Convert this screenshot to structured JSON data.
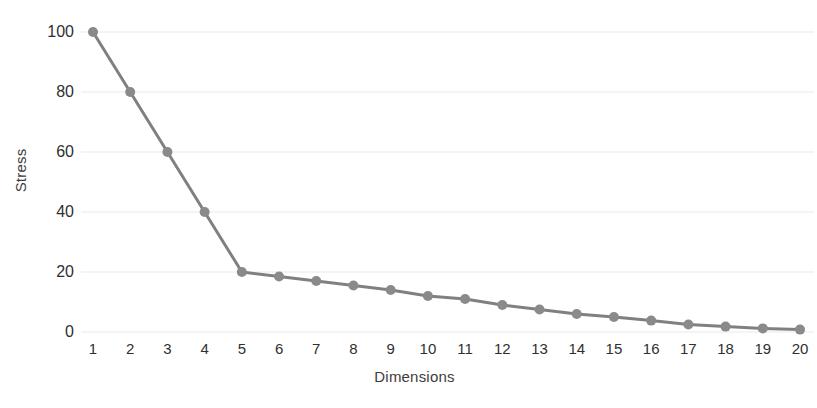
{
  "chart_data": {
    "type": "line",
    "title": "",
    "subtitle": "",
    "xlabel": "Dimensions",
    "ylabel": "Stress",
    "categories": [
      1,
      2,
      3,
      4,
      5,
      6,
      7,
      8,
      9,
      10,
      11,
      12,
      13,
      14,
      15,
      16,
      17,
      18,
      19,
      20
    ],
    "x_tick_labels": [
      "1",
      "2",
      "3",
      "4",
      "5",
      "6",
      "7",
      "8",
      "9",
      "10",
      "11",
      "12",
      "13",
      "14",
      "15",
      "16",
      "17",
      "18",
      "19",
      "20"
    ],
    "y_tick_labels": [
      "0",
      "20",
      "40",
      "60",
      "80",
      "100"
    ],
    "y_ticks": [
      0,
      20,
      40,
      60,
      80,
      100
    ],
    "values": [
      100,
      80,
      60,
      40,
      20,
      18.5,
      17,
      15.5,
      14,
      12,
      11,
      9,
      7.5,
      6,
      5,
      3.8,
      2.5,
      1.8,
      1.2,
      0.8
    ],
    "series": [
      {
        "name": "Stress",
        "values": [
          100,
          80,
          60,
          40,
          20,
          18.5,
          17,
          15.5,
          14,
          12,
          11,
          9,
          7.5,
          6,
          5,
          3.8,
          2.5,
          1.8,
          1.2,
          0.8
        ]
      }
    ],
    "xlim": [
      0.5,
      20.5
    ],
    "ylim": [
      0,
      100
    ],
    "grid": true,
    "grid_axis": "y",
    "legend": false,
    "legend_position": "none",
    "marker": "circle",
    "annotations": []
  },
  "style": {
    "line_color": "#808080",
    "marker_color": "#8a8a8a",
    "grid_color": "#e9e9e9",
    "text_color": "#2f2f2f",
    "background": "#ffffff",
    "line_width": 3,
    "marker_radius": 5
  },
  "layout": {
    "plot_left": 93,
    "plot_right": 800,
    "plot_top": 32,
    "plot_bottom": 332
  }
}
